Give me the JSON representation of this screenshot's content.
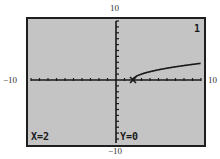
{
  "window_labels": {
    "ymax": "10",
    "ymin": "−10",
    "xmin": "−10",
    "xmax": "10"
  },
  "screen": {
    "graph_number": "1",
    "x_readout": "X=2",
    "y_readout": "Y=0",
    "background_color": "#c4c4c4",
    "ink_color": "#1a1a1a",
    "cursor_icon": "x-cross-cursor-icon"
  },
  "chart_data": {
    "type": "line",
    "title": "",
    "function": "y = sqrt(x - 2)",
    "xlabel": "",
    "ylabel": "",
    "xlim": [
      -10,
      10
    ],
    "ylim": [
      -10,
      10
    ],
    "xscale_ticks": 1,
    "yscale_ticks": 1,
    "grid": false,
    "legend": null,
    "x": [
      2,
      3,
      4,
      5,
      6,
      7,
      8,
      9,
      10
    ],
    "y": [
      0,
      1.0,
      1.41,
      1.73,
      2.0,
      2.24,
      2.45,
      2.65,
      2.83
    ],
    "trace_point": {
      "x": 2,
      "y": 0
    },
    "annotations": [
      "1",
      "X=2",
      "Y=0"
    ]
  }
}
